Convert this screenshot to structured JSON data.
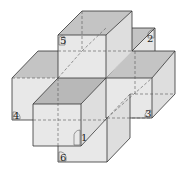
{
  "diagram": {
    "type": "3d-cube-cross",
    "labels": [
      "1",
      "2",
      "3",
      "4",
      "5",
      "6"
    ],
    "colors": {
      "front_face": "#e8e8e8",
      "side_face": "#dcdcdc",
      "top_face": "#b8b8b8",
      "edge": "#333333",
      "hidden_edge": "#555555"
    }
  },
  "labels": {
    "l1": "1",
    "l2": "2",
    "l3": "3",
    "l4": "4",
    "l5": "5",
    "l6": "6"
  }
}
